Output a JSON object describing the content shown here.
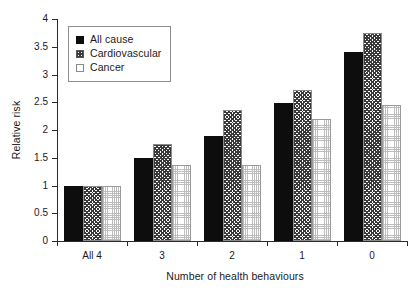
{
  "chart_data": {
    "type": "bar",
    "title": "",
    "xlabel": "Number of health behaviours",
    "ylabel": "Relative risk",
    "categories": [
      "All 4",
      "3",
      "2",
      "1",
      "0"
    ],
    "ylim": [
      0,
      4
    ],
    "yticks": [
      "0",
      "0.5",
      "1",
      "1.5",
      "2",
      "2.5",
      "3",
      "3.5",
      "4"
    ],
    "ytick_values": [
      0,
      0.5,
      1,
      1.5,
      2,
      2.5,
      3,
      3.5,
      4
    ],
    "grid": false,
    "legend_position": "top-left",
    "series": [
      {
        "name": "All cause",
        "pattern": "solid-black",
        "values": [
          1.0,
          1.5,
          1.89,
          2.49,
          3.4
        ]
      },
      {
        "name": "Cardiovascular",
        "pattern": "hatched",
        "values": [
          1.0,
          1.75,
          2.36,
          2.72,
          3.75
        ]
      },
      {
        "name": "Cancer",
        "pattern": "dotted-light",
        "values": [
          1.0,
          1.37,
          1.37,
          2.2,
          2.45
        ]
      }
    ]
  }
}
